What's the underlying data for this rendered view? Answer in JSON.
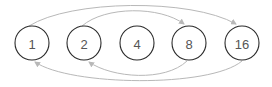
{
  "diagram": {
    "nodes": [
      {
        "id": "n1",
        "label": "1",
        "cx": 32,
        "cy": 43
      },
      {
        "id": "n2",
        "label": "2",
        "cx": 84,
        "cy": 43
      },
      {
        "id": "n4",
        "label": "4",
        "cx": 137,
        "cy": 43
      },
      {
        "id": "n8",
        "label": "8",
        "cx": 189,
        "cy": 43
      },
      {
        "id": "n16",
        "label": "16",
        "cx": 242,
        "cy": 43
      }
    ],
    "node_radius": 17,
    "edges": [
      {
        "from": "1",
        "to": "16",
        "side": "top"
      },
      {
        "from": "2",
        "to": "8",
        "side": "top"
      },
      {
        "from": "8",
        "to": "2",
        "side": "bottom"
      },
      {
        "from": "16",
        "to": "1",
        "side": "bottom"
      }
    ],
    "colors": {
      "node_stroke": "#2b2b2b",
      "label": "#555555",
      "edge": "#b8b8b8"
    }
  }
}
